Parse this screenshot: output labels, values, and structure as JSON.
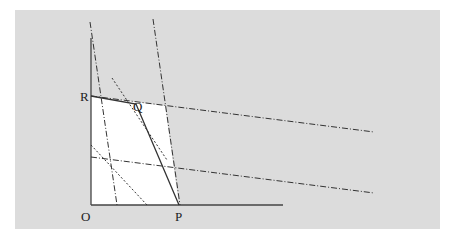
{
  "figure": {
    "type": "linear-programming-diagram",
    "labels": {
      "origin": "O",
      "point_p": "P",
      "point_q": "Q",
      "point_r": "R"
    },
    "colors": {
      "background": "#dcdcdc",
      "feasible_region": "#ffffff",
      "lines": "#333333"
    },
    "lines": [
      {
        "name": "steep-constraint-1",
        "style": "dash-dot"
      },
      {
        "name": "steep-constraint-2",
        "style": "dash-dot"
      },
      {
        "name": "shallow-constraint-1",
        "style": "dash-dot"
      },
      {
        "name": "shallow-constraint-2",
        "style": "dash-dot"
      },
      {
        "name": "objective-line-1",
        "style": "dotted"
      },
      {
        "name": "objective-line-2",
        "style": "dotted"
      },
      {
        "name": "frontier-r-q-p",
        "style": "solid"
      }
    ]
  }
}
